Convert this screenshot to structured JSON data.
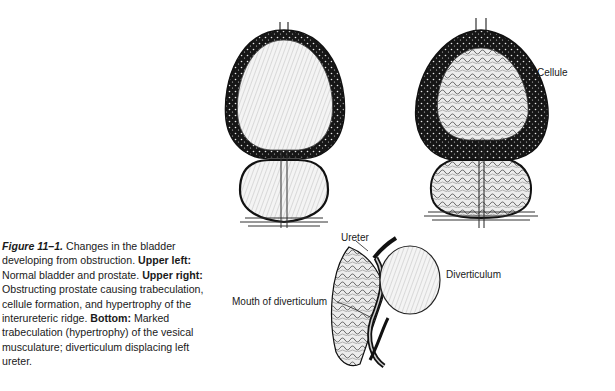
{
  "caption": {
    "figure_number": "Figure 11–1.",
    "intro": "Changes in the bladder developing from obstruction.",
    "parts": [
      {
        "heading": "Upper left:",
        "text": "Normal bladder and prostate."
      },
      {
        "heading": "Upper right:",
        "text": "Obstructing prostate causing trabeculation, cellule formation, and hypertrophy of the interureteric ridge."
      },
      {
        "heading": "Bottom:",
        "text": "Marked trabeculation (hypertrophy) of the vesical musculature; diverticulum displacing left ureter."
      }
    ]
  },
  "illustrations": {
    "upper_left": {
      "description": "Normal bladder and prostate"
    },
    "upper_right": {
      "description": "Obstructed bladder with trabeculation and cellules",
      "labels": [
        "Cellule"
      ]
    },
    "bottom": {
      "description": "Trabeculated bladder with diverticulum",
      "labels": [
        "Ureter",
        "Diverticulum",
        "Mouth of diverticulum"
      ]
    }
  }
}
